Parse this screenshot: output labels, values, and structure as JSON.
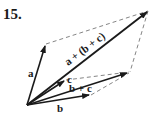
{
  "problem_number": "15.",
  "diagram": {
    "type": "vector-addition",
    "vectors": [
      {
        "name": "a",
        "label": "a"
      },
      {
        "name": "b",
        "label": "b"
      },
      {
        "name": "c",
        "label": "c"
      },
      {
        "name": "b_plus_c",
        "label": "b + c"
      },
      {
        "name": "sum",
        "label": "a + (b + c)"
      }
    ],
    "colors": {
      "vector": "#1a1a1a",
      "dashed": "#777777"
    }
  }
}
